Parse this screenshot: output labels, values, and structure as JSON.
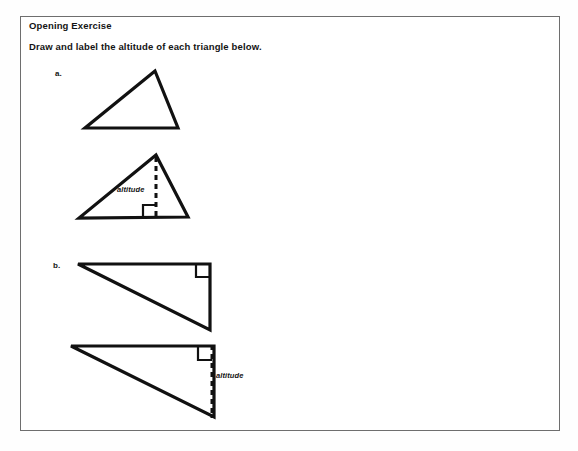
{
  "page": {
    "background_color": "#ffffff",
    "frame_border_color": "#6e6e6e",
    "ink_color": "#111111"
  },
  "heading": {
    "title": "Opening Exercise"
  },
  "instructions": {
    "text": "Draw and label the altitude of each triangle below."
  },
  "problems": [
    {
      "label": "a.",
      "figures": [
        {
          "name": "acute-triangle-plain",
          "type": "triangle",
          "has_altitude": false,
          "vertices": [
            [
              95,
              13
            ],
            [
              25,
              70
            ],
            [
              118,
              70
            ]
          ]
        },
        {
          "name": "acute-triangle-with-altitude",
          "type": "triangle",
          "has_altitude": true,
          "altitude_label": "altitude",
          "vertices": [
            [
              96,
              9
            ],
            [
              19,
              72
            ],
            [
              128,
              71
            ]
          ],
          "altitude_segment": [
            [
              96,
              9
            ],
            [
              96,
              71
            ]
          ],
          "right_angle_marker": [
            83,
            59,
            13,
            12
          ]
        }
      ]
    },
    {
      "label": "b.",
      "figures": [
        {
          "name": "right-triangle-plain",
          "type": "right-triangle",
          "has_altitude": false,
          "vertices": [
            [
              18,
              12
            ],
            [
              150,
              12
            ],
            [
              150,
              78
            ]
          ],
          "right_angle_marker": [
            136,
            12,
            13,
            13
          ]
        },
        {
          "name": "right-triangle-with-altitude",
          "type": "right-triangle",
          "has_altitude": true,
          "altitude_label": "altitude",
          "vertices": [
            [
              16,
              10
            ],
            [
              159,
              10
            ],
            [
              159,
              81
            ]
          ],
          "altitude_segment": [
            [
              157,
              9
            ],
            [
              157,
              82
            ]
          ],
          "right_angle_marker": [
            142,
            10,
            13,
            13
          ]
        }
      ]
    }
  ]
}
